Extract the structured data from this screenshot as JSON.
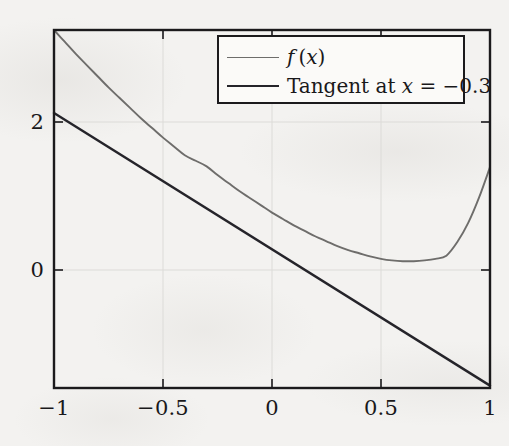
{
  "figure": {
    "background_color": "#f3f2f0",
    "frame_color": "#1b1a1c",
    "grid_color": "#dcdbd8",
    "title": ""
  },
  "axes": {
    "x_ticks": [
      {
        "value": -1,
        "label": "−1"
      },
      {
        "value": -0.5,
        "label": "−0.5"
      },
      {
        "value": 0,
        "label": "0"
      },
      {
        "value": 0.5,
        "label": "0.5"
      },
      {
        "value": 1,
        "label": "1"
      }
    ],
    "y_ticks": [
      {
        "value": 2,
        "label": "2"
      },
      {
        "value": 0,
        "label": "0"
      }
    ],
    "xlim": [
      -1,
      1
    ],
    "ylim": [
      -1.62,
      2.87
    ],
    "xlabel": "",
    "ylabel": ""
  },
  "legend": {
    "position": "top-right-inside",
    "entries": [
      {
        "label_html": "<span class=\"mathvar\">f</span> (<span class=\"mathvar\">x</span>)",
        "label_text": "f(x)",
        "color": "#6e6d6b",
        "width": 1.8
      },
      {
        "label_html": "Tangent at <span class=\"mathvar\">x</span> = −0.3",
        "label_text": "Tangent at x = −0.3",
        "color": "#25242a",
        "width": 2.2
      }
    ]
  },
  "chart_data": {
    "type": "line",
    "title": "",
    "xlabel": "",
    "ylabel": "",
    "xlim": [
      -1,
      1
    ],
    "ylim": [
      -1.62,
      2.87
    ],
    "grid": true,
    "legend_position": "upper right",
    "annotations": [
      {
        "text": "Tangent point at x = -0.3",
        "x": -0.3,
        "y": 1.16
      }
    ],
    "series": [
      {
        "name": "f(x)",
        "color": "#6e6d6b",
        "x": [
          -1.0,
          -0.95,
          -0.9,
          -0.85,
          -0.8,
          -0.75,
          -0.7,
          -0.65,
          -0.6,
          -0.55,
          -0.5,
          -0.45,
          -0.4,
          -0.35,
          -0.3,
          -0.25,
          -0.2,
          -0.15,
          -0.1,
          -0.05,
          0.0,
          0.05,
          0.1,
          0.15,
          0.2,
          0.25,
          0.3,
          0.35,
          0.4,
          0.45,
          0.5,
          0.55,
          0.6,
          0.65,
          0.7,
          0.75,
          0.8,
          0.85,
          0.9,
          0.95,
          1.0
        ],
        "y": [
          2.87,
          2.72,
          2.57,
          2.43,
          2.29,
          2.15,
          2.02,
          1.89,
          1.76,
          1.64,
          1.52,
          1.41,
          1.3,
          1.23,
          1.16,
          1.05,
          0.95,
          0.85,
          0.76,
          0.67,
          0.58,
          0.5,
          0.42,
          0.35,
          0.28,
          0.22,
          0.16,
          0.11,
          0.07,
          0.03,
          0.0,
          -0.02,
          -0.03,
          -0.03,
          -0.02,
          0.0,
          0.04,
          0.21,
          0.45,
          0.77,
          1.15
        ]
      },
      {
        "name": "Tangent at x = -0.3",
        "color": "#25242a",
        "x": [
          -1.0,
          1.0
        ],
        "y": [
          1.83,
          -1.59
        ]
      }
    ]
  }
}
